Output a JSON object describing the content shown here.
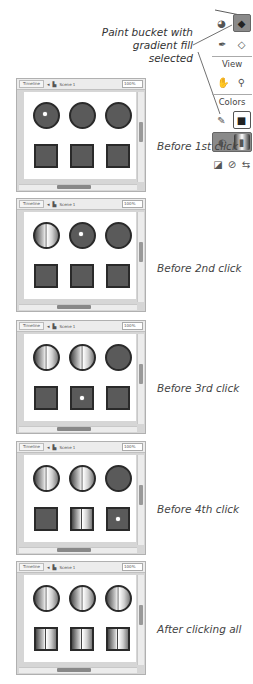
{
  "callout": {
    "line1": "Paint bucket with",
    "line2": "gradient fill selected"
  },
  "tools_panel": {
    "row1": [
      {
        "name": "ink-bottle-icon",
        "glyph": "◕"
      },
      {
        "name": "paint-bucket-icon",
        "glyph": "◆",
        "selected": true
      }
    ],
    "row2": [
      {
        "name": "eyedropper-icon",
        "glyph": "✒"
      },
      {
        "name": "eraser-icon",
        "glyph": "◇"
      }
    ],
    "view_label": "View",
    "row3": [
      {
        "name": "hand-icon",
        "glyph": "✋"
      },
      {
        "name": "zoom-icon",
        "glyph": "⚲"
      }
    ],
    "colors_label": "Colors",
    "row4": [
      {
        "name": "stroke-color-icon",
        "glyph": "✎"
      },
      {
        "name": "fill-color-swatch",
        "glyph": "■"
      }
    ],
    "row5": [
      {
        "name": "lock-fill-icon",
        "glyph": "◐"
      },
      {
        "name": "gradient-swatch",
        "glyph": "▮"
      }
    ],
    "row6": [
      {
        "name": "black-white-icon",
        "glyph": "◪"
      },
      {
        "name": "no-color-icon",
        "glyph": "⊘"
      },
      {
        "name": "swap-colors-icon",
        "glyph": "⇆"
      }
    ]
  },
  "timeline_bar": {
    "timeline_label": "Timeline",
    "scene_label": "Scene 1",
    "zoom_value": "100%"
  },
  "frames": [
    {
      "caption": "Before 1st click",
      "fills": [
        "solid",
        "solid",
        "solid",
        "solid",
        "solid",
        "solid"
      ],
      "cursor": 0
    },
    {
      "caption": "Before 2nd click",
      "fills": [
        "grad",
        "solid",
        "solid",
        "solid",
        "solid",
        "solid"
      ],
      "cursor": 1
    },
    {
      "caption": "Before 3rd click",
      "fills": [
        "grad",
        "grad",
        "solid",
        "solid",
        "solid",
        "solid"
      ],
      "cursor": 4
    },
    {
      "caption": "Before 4th click",
      "fills": [
        "grad",
        "grad",
        "solid",
        "solid",
        "grad",
        "solid"
      ],
      "cursor": 5
    },
    {
      "caption": "After clicking all",
      "fills": [
        "grad",
        "grad",
        "grad",
        "grad",
        "grad",
        "grad"
      ],
      "cursor": -1
    }
  ],
  "colors": {
    "shape_fill": "#5a5a5a",
    "shape_stroke": "#2a2a2a",
    "selected_tool": "#8a8a8a"
  }
}
